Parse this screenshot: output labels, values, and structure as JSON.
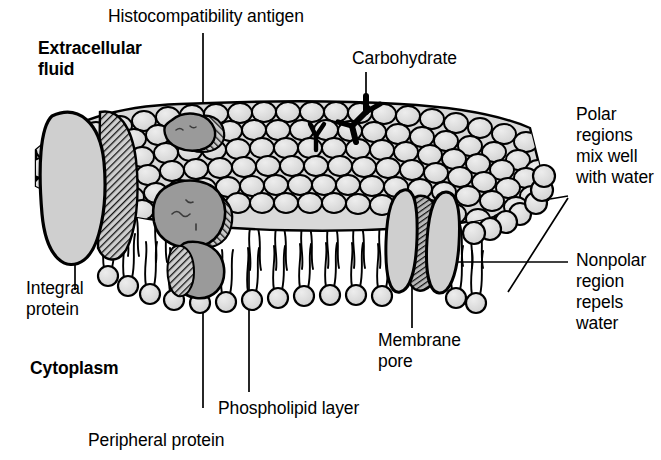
{
  "figure": {
    "type": "diagram",
    "background_color": "#ffffff",
    "line_color": "#000000"
  },
  "colors": {
    "head_fill": "#d9d9d9",
    "protein_fill": "#c8c8c8",
    "dark_protein_fill": "#9a9a9a",
    "outline": "#000000",
    "hatch": "#1a1a1a"
  },
  "labels": {
    "extracellular_fluid": "Extracellular\nfluid",
    "histocompatibility_antigen": "Histocompatibility antigen",
    "carbohydrate": "Carbohydrate",
    "polar_regions": "Polar\nregions\nmix well\nwith water",
    "nonpolar_region": "Nonpolar\nregion\nrepels\nwater",
    "integral_protein": "Integral\nprotein",
    "cytoplasm": "Cytoplasm",
    "membrane_pore": "Membrane\npore",
    "phospholipid_layer": "Phospholipid layer",
    "peripheral_protein": "Peripheral protein"
  },
  "label_styles": {
    "extracellular_fluid": "bold",
    "cytoplasm": "bold",
    "histocompatibility_antigen": "regular",
    "carbohydrate": "regular",
    "polar_regions": "regular",
    "nonpolar_region": "regular",
    "integral_protein": "regular",
    "membrane_pore": "regular",
    "phospholipid_layer": "regular",
    "peripheral_protein": "regular"
  },
  "structures": [
    {
      "name": "integral-protein",
      "description": "large light-gray oval spanning bilayer at left edge with dark hatched right face"
    },
    {
      "name": "histocompatibility-antigen",
      "description": "small dark-gray protein blob on upper membrane surface"
    },
    {
      "name": "peripheral-protein",
      "description": "large dark-gray protein blob on inner surface below antigen"
    },
    {
      "name": "membrane-pore",
      "description": "two light-gray curved subunits flanking dark hatched channel through bilayer at right"
    },
    {
      "name": "carbohydrate-chain-large",
      "description": "thick black branched Y glycan on upper surface right of center"
    },
    {
      "name": "carbohydrate-chain-small",
      "description": "small black branched Y glycan on upper surface center"
    },
    {
      "name": "phospholipid-bilayer",
      "description": "two leaflets of circular polar head groups with paired wavy nonpolar tails facing inward"
    },
    {
      "name": "membrane-top-surface",
      "description": "dense three-dimensional field of overlapping scale-like polar head groups"
    }
  ]
}
